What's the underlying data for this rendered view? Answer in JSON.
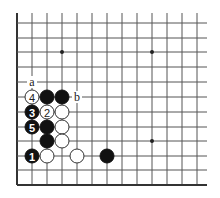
{
  "board": {
    "columns_x": [
      17,
      32,
      47,
      62,
      77,
      92,
      107,
      122,
      137,
      152,
      167,
      182,
      197
    ],
    "rows_y": [
      23,
      38,
      52,
      67,
      82,
      97,
      112,
      127,
      141,
      156,
      170,
      185
    ],
    "line_extent": {
      "top": 13,
      "right": 207
    },
    "edges": [
      "left",
      "bottom"
    ],
    "colors": {
      "line": "#555555",
      "edge": "#333333",
      "black_stone": "#111111",
      "white_stone": "#ffffff",
      "background": "#ffffff"
    }
  },
  "star_points": [
    {
      "col": 3,
      "row": 2
    },
    {
      "col": 9,
      "row": 2
    },
    {
      "col": 9,
      "row": 8
    }
  ],
  "stones": [
    {
      "color": "white",
      "col": 1,
      "row": 5,
      "number": "4"
    },
    {
      "color": "black",
      "col": 2,
      "row": 5,
      "number": ""
    },
    {
      "color": "black",
      "col": 3,
      "row": 5,
      "number": ""
    },
    {
      "color": "black",
      "col": 1,
      "row": 6,
      "number": "3"
    },
    {
      "color": "white",
      "col": 2,
      "row": 6,
      "number": "2"
    },
    {
      "color": "white",
      "col": 3,
      "row": 6,
      "number": ""
    },
    {
      "color": "black",
      "col": 1,
      "row": 7,
      "number": "5"
    },
    {
      "color": "black",
      "col": 2,
      "row": 7,
      "number": ""
    },
    {
      "color": "white",
      "col": 3,
      "row": 7,
      "number": ""
    },
    {
      "color": "black",
      "col": 2,
      "row": 8,
      "number": ""
    },
    {
      "color": "white",
      "col": 3,
      "row": 8,
      "number": ""
    },
    {
      "color": "black",
      "col": 1,
      "row": 9,
      "number": "1"
    },
    {
      "color": "white",
      "col": 2,
      "row": 9,
      "number": ""
    },
    {
      "color": "white",
      "col": 4,
      "row": 9,
      "number": ""
    },
    {
      "color": "black",
      "col": 6,
      "row": 9,
      "number": ""
    }
  ],
  "labels": [
    {
      "text": "a",
      "col": 1,
      "row": 4
    },
    {
      "text": "b",
      "col": 4,
      "row": 5
    }
  ]
}
